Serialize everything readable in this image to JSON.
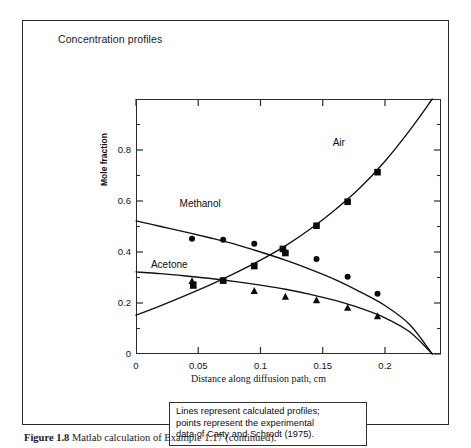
{
  "figure": {
    "caption_bold": "Figure 1.8",
    "caption_text": " Matlab calculation of Example 1.17 (continued)."
  },
  "chart_title": "Concentration profiles",
  "annotation": {
    "line1": "Lines represent calculated profiles;",
    "line2": "points represent the experimental",
    "line3": "data of Carty and Schrodt (1975)."
  },
  "chart_data": {
    "type": "line",
    "title": "Concentration profiles",
    "xlabel": "Distance along diffusion path, cm",
    "ylabel": "Mole fraction",
    "xlim": [
      0,
      0.245
    ],
    "ylim": [
      0,
      1.0
    ],
    "xticks": [
      0,
      0.05,
      0.1,
      0.15,
      0.2
    ],
    "xticklabels": [
      "0",
      "0.05",
      "0.1",
      "0.15",
      "0.2"
    ],
    "yticks": [
      0,
      0.2,
      0.4,
      0.6,
      0.8
    ],
    "yticklabels": [
      "0",
      "0.2",
      "0.4",
      "0.6",
      "0.8"
    ],
    "minor_yticks": [
      0.1,
      0.3,
      0.5,
      0.7,
      0.9
    ],
    "grid": false,
    "legend_position": "inline-labels",
    "annotations": [
      {
        "text": "Methanol",
        "x": 0.035,
        "y": 0.585
      },
      {
        "text": "Acetone",
        "x": 0.012,
        "y": 0.345
      },
      {
        "text": "Air",
        "x": 0.158,
        "y": 0.825
      }
    ],
    "series": [
      {
        "name": "Methanol",
        "marker": "circle",
        "line_x": [
          0.0,
          0.02,
          0.04,
          0.06,
          0.08,
          0.1,
          0.12,
          0.14,
          0.16,
          0.18,
          0.2,
          0.22,
          0.238
        ],
        "line_y": [
          0.522,
          0.5,
          0.478,
          0.455,
          0.43,
          0.4,
          0.368,
          0.332,
          0.292,
          0.244,
          0.19,
          0.115,
          0.0
        ],
        "points_x": [
          0.045,
          0.07,
          0.095,
          0.118,
          0.12,
          0.145,
          0.17,
          0.194
        ],
        "points_y": [
          0.452,
          0.448,
          0.432,
          0.412,
          0.398,
          0.373,
          0.303,
          0.236
        ]
      },
      {
        "name": "Acetone",
        "marker": "triangle",
        "line_x": [
          0.0,
          0.02,
          0.04,
          0.06,
          0.08,
          0.1,
          0.12,
          0.14,
          0.16,
          0.18,
          0.2,
          0.22,
          0.238
        ],
        "line_y": [
          0.322,
          0.315,
          0.306,
          0.296,
          0.284,
          0.27,
          0.254,
          0.234,
          0.21,
          0.18,
          0.142,
          0.086,
          0.0
        ],
        "points_x": [
          0.045,
          0.046,
          0.07,
          0.095,
          0.12,
          0.145,
          0.17,
          0.194
        ],
        "points_y": [
          0.286,
          0.268,
          0.288,
          0.247,
          0.225,
          0.211,
          0.181,
          0.148
        ]
      },
      {
        "name": "Air",
        "marker": "square",
        "line_x": [
          0.0,
          0.02,
          0.04,
          0.06,
          0.08,
          0.1,
          0.12,
          0.14,
          0.16,
          0.18,
          0.2,
          0.22,
          0.238
        ],
        "line_y": [
          0.152,
          0.19,
          0.23,
          0.272,
          0.318,
          0.368,
          0.424,
          0.49,
          0.566,
          0.652,
          0.756,
          0.878,
          1.0
        ],
        "points_x": [
          0.046,
          0.07,
          0.095,
          0.118,
          0.12,
          0.145,
          0.17,
          0.194
        ],
        "points_y": [
          0.272,
          0.288,
          0.345,
          0.412,
          0.396,
          0.503,
          0.597,
          0.713
        ]
      }
    ]
  }
}
